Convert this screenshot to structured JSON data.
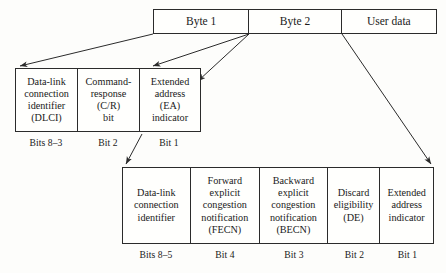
{
  "diagram": {
    "line_color": "#2b2b2b",
    "background": "#fdfdfb"
  },
  "frame_row": {
    "name": "frame-structure",
    "cells": [
      {
        "label": "Byte 1"
      },
      {
        "label": "Byte 2"
      },
      {
        "label": "User data"
      }
    ]
  },
  "byte1_row": {
    "name": "byte-1-expansion",
    "cells": [
      {
        "lines": [
          "Data-link",
          "connection",
          "identifier",
          "(DLCI)"
        ]
      },
      {
        "lines": [
          "Command-",
          "response",
          "(C/R)",
          "bit"
        ]
      },
      {
        "lines": [
          "Extended",
          "address",
          "(EA)",
          "indicator"
        ]
      }
    ],
    "bit_labels": [
      "Bits 8–3",
      "Bit 2",
      "Bit 1"
    ]
  },
  "byte2_row": {
    "name": "byte-2-expansion",
    "cells": [
      {
        "lines": [
          "Data-link",
          "connection",
          "identifier"
        ]
      },
      {
        "lines": [
          "Forward",
          "explicit",
          "congestion",
          "notification",
          "(FECN)"
        ]
      },
      {
        "lines": [
          "Backward",
          "explicit",
          "congestion",
          "notification",
          "(BECN)"
        ]
      },
      {
        "lines": [
          "Discard",
          "eligibility",
          "(DE)"
        ]
      },
      {
        "lines": [
          "Extended",
          "address",
          "indicator"
        ]
      }
    ],
    "bit_labels": [
      "Bits 8–5",
      "Bit 4",
      "Bit 3",
      "Bit 2",
      "Bit 1"
    ]
  }
}
